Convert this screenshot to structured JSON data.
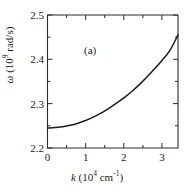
{
  "figure": {
    "panel_label": "(a)",
    "background_color": "#ffffff",
    "curve_color": "#1b1b1b",
    "axis_color": "#2a2a2a"
  },
  "axes": {
    "x": {
      "label_symbol": "k",
      "label_units_mantissa": "10",
      "label_units_exponent": "4",
      "label_units_unit": "cm",
      "label_units_unit_exponent": "-1",
      "label_full": "k (10^4 cm^-1)",
      "ticks": [
        "0",
        "1",
        "2",
        "3"
      ],
      "tick_values": [
        0,
        1,
        2,
        3
      ],
      "range": [
        0,
        3.42
      ]
    },
    "y": {
      "label_symbol": "ω",
      "label_units_mantissa": "10",
      "label_units_exponent": "9",
      "label_units_unit": "rad/s",
      "label_full": "ω (10^9 rad/s)",
      "ticks": [
        "2.2",
        "2.3",
        "2.4",
        "2.5"
      ],
      "tick_values": [
        2.2,
        2.3,
        2.4,
        2.5
      ],
      "range": [
        2.2,
        2.5
      ]
    }
  },
  "chart_data": {
    "type": "line",
    "title": "",
    "subtitle": "",
    "annotations": [
      "(a)"
    ],
    "xlabel": "k (10^4 cm^-1)",
    "ylabel": "ω (10^9 rad/s)",
    "xlim": [
      0,
      3.42
    ],
    "ylim": [
      2.2,
      2.5
    ],
    "xticks": [
      0,
      1,
      2,
      3
    ],
    "yticks": [
      2.2,
      2.3,
      2.4,
      2.5
    ],
    "grid": false,
    "legend": null,
    "series": [
      {
        "name": "dispersion",
        "x": [
          0.0,
          0.2,
          0.4,
          0.6,
          0.8,
          1.0,
          1.2,
          1.4,
          1.6,
          1.8,
          2.0,
          2.2,
          2.4,
          2.6,
          2.8,
          3.0,
          3.2,
          3.42
        ],
        "y": [
          2.245,
          2.2462,
          2.248,
          2.2513,
          2.256,
          2.262,
          2.2695,
          2.2785,
          2.289,
          2.3005,
          2.313,
          2.327,
          2.3425,
          2.3595,
          2.378,
          2.3975,
          2.419,
          2.455
        ]
      }
    ]
  }
}
